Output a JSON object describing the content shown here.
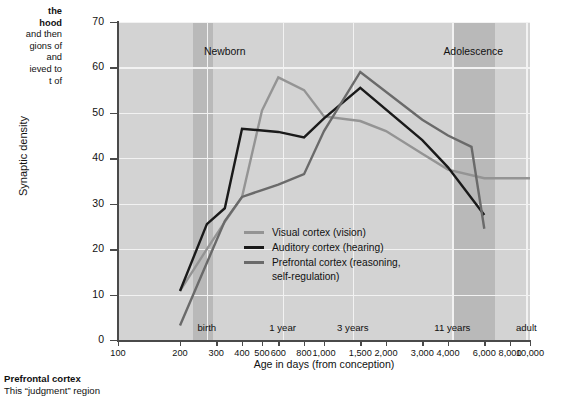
{
  "caption": {
    "left_lines": [
      "the",
      "hood",
      "and then",
      "gions of",
      "and",
      "ieved to",
      "t of"
    ],
    "bottom_heading": "Prefrontal cortex",
    "bottom_line": "This “judgment” region"
  },
  "chart_data": {
    "type": "line",
    "title": "",
    "xlabel": "Age in days (from conception)",
    "ylabel": "Synaptic density",
    "xscale": "log",
    "xlim": [
      100,
      10000
    ],
    "ylim": [
      0,
      70
    ],
    "yticks": [
      0,
      10,
      20,
      30,
      40,
      50,
      60,
      70
    ],
    "xticks": [
      100,
      200,
      300,
      400,
      500,
      600,
      800,
      1000,
      1500,
      2000,
      3000,
      4000,
      6000,
      8000,
      10000
    ],
    "xticklabels": [
      "100",
      "200",
      "300",
      "400",
      "500",
      "600",
      "800",
      "1,000",
      "1,500",
      "2,000",
      "3,000",
      "4,000",
      "6,000",
      "8,000",
      "10,000"
    ],
    "grid": true,
    "legend_position": "center",
    "plot_background": "#d3d3d3",
    "bands": [
      {
        "label": "Newborn",
        "x_start": 230,
        "x_end": 290,
        "color": "#b9b9b9",
        "label_x": 330
      },
      {
        "label": "Adolescence",
        "x_start": 4300,
        "x_end": 6800,
        "color": "#b9b9b9",
        "label_x": 5300
      }
    ],
    "age_markers": [
      {
        "label": "birth",
        "x": 270
      },
      {
        "label": "1 year",
        "x": 630
      },
      {
        "label": "3 years",
        "x": 1380
      },
      {
        "label": "11 years",
        "x": 4200
      },
      {
        "label": "adult",
        "x": 9600
      }
    ],
    "series": [
      {
        "name": "Visual cortex (vision)",
        "color": "#949494",
        "points": [
          {
            "x": 200,
            "y": 10.8
          },
          {
            "x": 270,
            "y": 20.0
          },
          {
            "x": 330,
            "y": 26.0
          },
          {
            "x": 400,
            "y": 31.5
          },
          {
            "x": 500,
            "y": 50.5
          },
          {
            "x": 600,
            "y": 57.8
          },
          {
            "x": 800,
            "y": 55.0
          },
          {
            "x": 1000,
            "y": 49.2
          },
          {
            "x": 1500,
            "y": 48.2
          },
          {
            "x": 2000,
            "y": 46.0
          },
          {
            "x": 3000,
            "y": 41.0
          },
          {
            "x": 4000,
            "y": 37.5
          },
          {
            "x": 6000,
            "y": 35.6
          },
          {
            "x": 10000,
            "y": 35.6
          }
        ]
      },
      {
        "name": "Auditory cortex (hearing)",
        "color": "#1a1a1a",
        "points": [
          {
            "x": 200,
            "y": 10.8
          },
          {
            "x": 270,
            "y": 25.5
          },
          {
            "x": 330,
            "y": 29.0
          },
          {
            "x": 400,
            "y": 46.5
          },
          {
            "x": 600,
            "y": 45.8
          },
          {
            "x": 800,
            "y": 44.6
          },
          {
            "x": 1000,
            "y": 48.8
          },
          {
            "x": 1500,
            "y": 55.5
          },
          {
            "x": 3000,
            "y": 44.0
          },
          {
            "x": 4000,
            "y": 38.0
          },
          {
            "x": 6000,
            "y": 27.5
          }
        ]
      },
      {
        "name": "Prefrontal cortex (reasoning,\nself-regulation)",
        "color": "#6a6a6a",
        "points": [
          {
            "x": 200,
            "y": 3.2
          },
          {
            "x": 330,
            "y": 26.2
          },
          {
            "x": 400,
            "y": 31.5
          },
          {
            "x": 500,
            "y": 33.0
          },
          {
            "x": 600,
            "y": 34.2
          },
          {
            "x": 800,
            "y": 36.5
          },
          {
            "x": 1000,
            "y": 46.0
          },
          {
            "x": 1500,
            "y": 59.0
          },
          {
            "x": 3000,
            "y": 48.5
          },
          {
            "x": 4000,
            "y": 45.0
          },
          {
            "x": 5200,
            "y": 42.5
          },
          {
            "x": 6000,
            "y": 24.5
          }
        ]
      }
    ]
  }
}
